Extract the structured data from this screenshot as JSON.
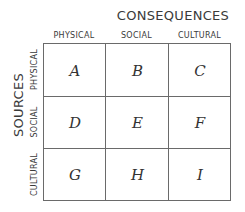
{
  "title": "CONSEQUENCES",
  "side_title": "SOURCES",
  "columns": [
    "PHYSICAL",
    "SOCIAL",
    "CULTURAL"
  ],
  "rows": [
    "PHYSICAL",
    "SOCIAL",
    "CULTURAL"
  ],
  "cells": [
    [
      "A",
      "B",
      "C"
    ],
    [
      "D",
      "E",
      "F"
    ],
    [
      "G",
      "H",
      "I"
    ]
  ]
}
